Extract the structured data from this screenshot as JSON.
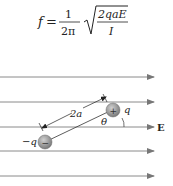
{
  "formula": {
    "lhs": "f",
    "equals": "=",
    "numerator": "1",
    "denominator": "2π",
    "radicand_numerator": "2qaE",
    "radicand_denominator": "I"
  },
  "diagram": {
    "field_label": "E",
    "negative_charge_label": "−q",
    "positive_charge_label": "q",
    "separation_label": "2a",
    "angle_label": "θ",
    "negative_sign": "−",
    "positive_sign": "+",
    "field_line_count": 5,
    "colors": {
      "field_line": "#8a8a8a",
      "charge_fill": "#9a9a9a",
      "text": "#222222"
    }
  }
}
